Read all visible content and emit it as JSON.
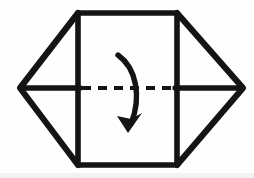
{
  "figure": {
    "canvas": {
      "width": 254,
      "height": 178,
      "background": "#fefefe"
    },
    "ink_color": "#141414"
  },
  "geometry": {
    "panel": {
      "name": "center-panel",
      "left": 78,
      "right": 177,
      "top": 13,
      "bottom": 165,
      "path": "M 78 13 L 177 13 L 177 165 L 78 165 Z"
    },
    "left_flap": {
      "name": "left-triangular-flap",
      "apex_x": 20,
      "apex_y": 88,
      "path": "M 78 13 L 20 88 L 78 165"
    },
    "right_flap": {
      "name": "right-triangular-flap",
      "apex_x": 243,
      "apex_y": 88,
      "path": "M 177 13 L 243 88 L 177 165"
    },
    "left_flap_spine": {
      "name": "left-flap-center-line",
      "path": "M 22 88 L 80 88"
    },
    "right_flap_spine": {
      "name": "right-flap-center-line",
      "path": "M 175 88 L 241 88"
    },
    "fold_line": {
      "name": "horizontal-dashed-fold-line",
      "y": 88,
      "x_start": 82,
      "x_end": 174,
      "dash_length": 9,
      "gap_length": 7,
      "style": "dashed"
    },
    "fold_arrow": {
      "name": "fold-down-curved-arrow",
      "direction": "downward",
      "bow": "right",
      "shaft_path": "M 118 55 C 136 68 142 96 131 124",
      "head_tip_x": 128,
      "head_tip_y": 133,
      "head_path": "M 128 133 L 117 116 L 131 119 L 142 113 Z",
      "start_x": 118,
      "start_y": 55
    }
  },
  "labels": {
    "panel": "center panel",
    "left_flap": "left flap",
    "right_flap": "right flap",
    "fold_line": "fold line",
    "fold_arrow": "fold direction"
  }
}
